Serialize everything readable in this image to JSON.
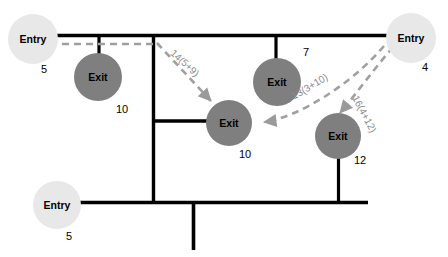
{
  "diagram": {
    "colors": {
      "entry_fill": "#e8e8e8",
      "exit_fill": "#7f7f7f",
      "edge": "#000000",
      "flow": "#8a8a8a"
    },
    "nodes": [
      {
        "id": "entry-top-left",
        "label": "Entry",
        "cost": "5",
        "x": 8,
        "y": 14,
        "d": 50
      },
      {
        "id": "exit-top-left",
        "label": "Exit",
        "cost": "10",
        "x": 74,
        "y": 53,
        "d": 48
      },
      {
        "id": "exit-top-middle",
        "label": "Exit",
        "cost": "7",
        "x": 253,
        "y": 58,
        "d": 48
      },
      {
        "id": "entry-top-right",
        "label": "Entry",
        "cost": "4",
        "x": 386,
        "y": 13,
        "d": 50
      },
      {
        "id": "exit-center",
        "label": "Exit",
        "cost": "10",
        "x": 206,
        "y": 100,
        "d": 46
      },
      {
        "id": "exit-bottom-right",
        "label": "Exit",
        "cost": "12",
        "x": 315,
        "y": 113,
        "d": 46
      },
      {
        "id": "entry-bottom-left",
        "label": "Entry",
        "cost": "5",
        "x": 33,
        "y": 181,
        "d": 48
      }
    ],
    "costs": [
      {
        "id": "cost-entry-top-left",
        "value": "5",
        "x": 41,
        "y": 64
      },
      {
        "id": "cost-exit-top-left",
        "value": "10",
        "x": 116,
        "y": 104
      },
      {
        "id": "cost-exit-top-middle",
        "value": "7",
        "x": 303,
        "y": 47
      },
      {
        "id": "cost-entry-top-right",
        "value": "4",
        "x": 422,
        "y": 62
      },
      {
        "id": "cost-exit-center",
        "value": "10",
        "x": 239,
        "y": 149
      },
      {
        "id": "cost-exit-bottom-right",
        "value": "12",
        "x": 354,
        "y": 155
      },
      {
        "id": "cost-entry-bottom-left",
        "value": "5",
        "x": 66,
        "y": 231
      }
    ],
    "flows": [
      {
        "id": "flow-14",
        "label": "14(5+9)",
        "x": 175,
        "y": 48,
        "rotate": 42
      },
      {
        "id": "flow-13",
        "label": "13(3+10)",
        "x": 290,
        "y": 93,
        "rotate": -31
      },
      {
        "id": "flow-16",
        "label": "16(4+12)",
        "x": 359,
        "y": 94,
        "rotate": 62
      }
    ]
  }
}
